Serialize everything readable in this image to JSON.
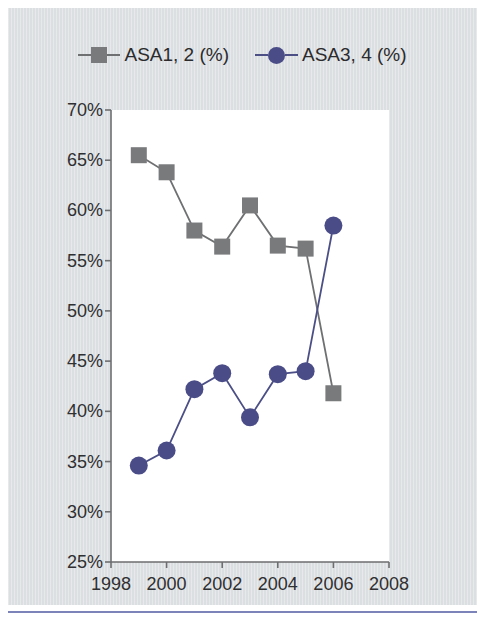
{
  "chart_data": {
    "type": "line",
    "title": "",
    "subtitle": "",
    "xlabel": "",
    "ylabel": "",
    "xlim": [
      1998,
      2008
    ],
    "ylim": [
      25,
      70
    ],
    "grid": false,
    "legend_position": "top-center",
    "x": [
      1999,
      2000,
      2001,
      2002,
      2003,
      2004,
      2005,
      2006
    ],
    "xtick_labels": [
      "1998",
      "2000",
      "2002",
      "2004",
      "2006",
      "2008"
    ],
    "xticks": [
      1998,
      2000,
      2002,
      2004,
      2006,
      2008
    ],
    "ytick_labels": [
      "70%",
      "65%",
      "60%",
      "55%",
      "50%",
      "45%",
      "40%",
      "35%",
      "30%",
      "25%"
    ],
    "yticks": [
      70,
      65,
      60,
      55,
      50,
      45,
      40,
      35,
      30,
      25
    ],
    "series": [
      {
        "name": "ASA1, 2 (%)",
        "marker": "square",
        "color": "#797a7c",
        "line_color": "#6f7072",
        "values": [
          65.5,
          63.8,
          58.0,
          56.4,
          60.5,
          56.5,
          56.2,
          41.8
        ]
      },
      {
        "name": "ASA3, 4 (%)",
        "marker": "circle",
        "color": "#4a4c88",
        "line_color": "#4b4f86",
        "values": [
          34.6,
          36.1,
          42.2,
          43.8,
          39.4,
          43.7,
          44.0,
          58.5
        ]
      }
    ]
  },
  "legend": {
    "entries": [
      {
        "label": "ASA1, 2 (%)",
        "symbol": "square-marker-icon"
      },
      {
        "label": "ASA3, 4 (%)",
        "symbol": "circle-marker-icon"
      }
    ]
  },
  "colors": {
    "page_background": "#dcdfe2",
    "plot_background": "#ffffff",
    "axis": "#6d6e70",
    "series_gray": "#797a7c",
    "series_blue": "#4a4c88",
    "bottom_rule": "#7b83b8"
  }
}
